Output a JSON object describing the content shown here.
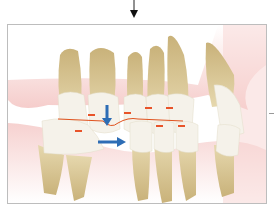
{
  "figure": {
    "colors": {
      "gum": "#f3c9c6",
      "tooth_crown": "#f4f1e6",
      "tooth_root": "#d8c48f",
      "occlusal_line": "#e0531f",
      "contact_marker": "#e8542a",
      "movement_arrow": "#2d6db5",
      "frame_border": "#bdbdbd"
    },
    "arrows": [
      {
        "name": "downward-arrow",
        "direction": "down"
      },
      {
        "name": "rightward-arrow",
        "direction": "right"
      }
    ],
    "contact_markers_count": 8
  }
}
